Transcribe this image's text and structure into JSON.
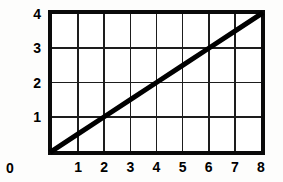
{
  "chart_data": {
    "type": "line",
    "title": "",
    "xlabel": "",
    "ylabel": "",
    "xlim": [
      0,
      8
    ],
    "ylim": [
      0,
      4
    ],
    "grid": true,
    "legend": false,
    "x_ticks": [
      "0",
      "1",
      "2",
      "3",
      "4",
      "5",
      "6",
      "7",
      "8"
    ],
    "y_ticks": [
      "1",
      "2",
      "3",
      "4"
    ],
    "origin_label": "0",
    "series": [
      {
        "name": "line",
        "x": [
          0,
          1,
          2,
          3,
          4,
          5,
          6,
          7,
          8
        ],
        "values": [
          0,
          0.5,
          1,
          1.5,
          2,
          2.5,
          3,
          3.5,
          4
        ],
        "slope": 0.5,
        "intercept": 0,
        "color": "#000000"
      }
    ]
  },
  "style": {
    "line_color": "#000000",
    "grid_color": "#1d1d1d",
    "border_color": "#0a0a0a",
    "background": "#ffffff"
  }
}
